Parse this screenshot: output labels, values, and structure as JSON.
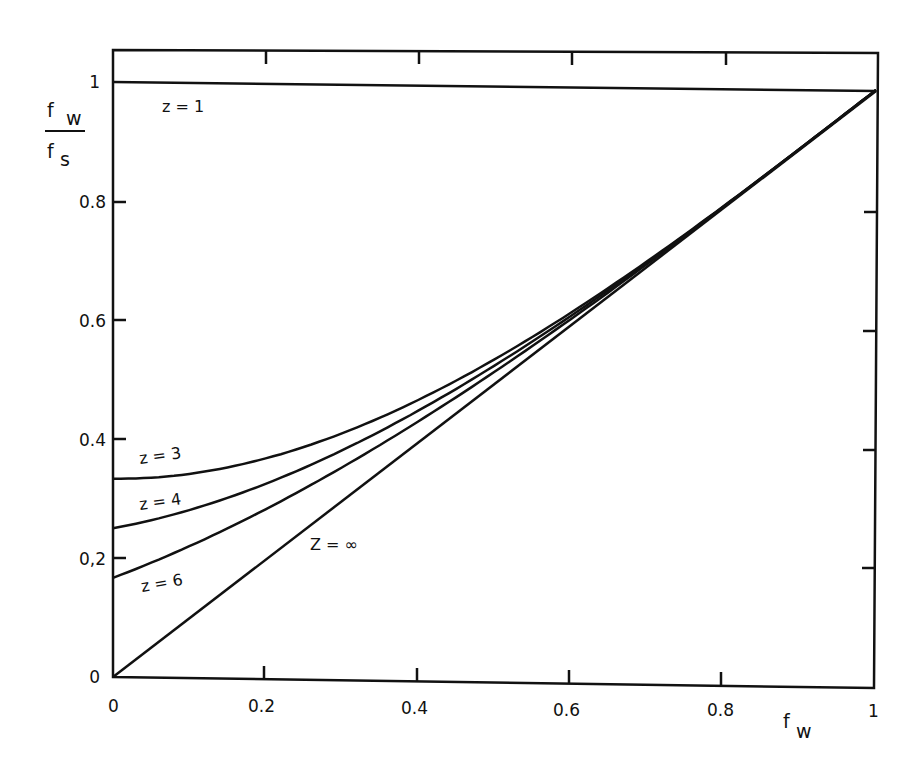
{
  "chart_data": {
    "type": "line",
    "title": "",
    "xlabel": "f_w",
    "ylabel": "f_w / f_s",
    "xlim": [
      0,
      1
    ],
    "ylim": [
      0,
      1.07
    ],
    "grid": false,
    "legend": "inline labels",
    "x_ticks": [
      "0",
      "0.2",
      "0.4",
      "0.6",
      "0.8",
      "1"
    ],
    "y_ticks": [
      "0",
      "0.2",
      "0.4",
      "0.6",
      "0.8",
      "1"
    ],
    "x": [
      0,
      0.1,
      0.2,
      0.3,
      0.4,
      0.5,
      0.6,
      0.7,
      0.8,
      0.9,
      1.0
    ],
    "series": [
      {
        "name": "z = 1",
        "values": [
          1,
          1,
          1,
          1,
          1,
          1,
          1,
          1,
          1,
          1,
          1
        ]
      },
      {
        "name": "z = 3",
        "values": [
          0.33,
          0.34,
          0.37,
          0.41,
          0.47,
          0.54,
          0.62,
          0.71,
          0.8,
          0.9,
          1.0
        ]
      },
      {
        "name": "z = 4",
        "values": [
          0.25,
          0.28,
          0.33,
          0.39,
          0.45,
          0.53,
          0.62,
          0.71,
          0.8,
          0.9,
          1.0
        ]
      },
      {
        "name": "z = 6",
        "values": [
          0.17,
          0.22,
          0.29,
          0.36,
          0.44,
          0.52,
          0.61,
          0.7,
          0.8,
          0.9,
          1.0
        ]
      },
      {
        "name": "z = ∞",
        "values": [
          0,
          0.1,
          0.2,
          0.3,
          0.4,
          0.5,
          0.6,
          0.7,
          0.8,
          0.9,
          1.0
        ]
      }
    ],
    "annotations": [
      "z = 1",
      "z = 3",
      "z = 4",
      "z = 6",
      "z = ∞"
    ]
  },
  "labels": {
    "y_num": "f",
    "y_num_sub": "w",
    "y_den": "f",
    "y_den_sub": "s",
    "x_main": "f",
    "x_sub": "w",
    "z1": "z  =  1",
    "z3": "z  = 3",
    "z4": "z  = 4",
    "z6": "z  = 6",
    "zinf": "Z  =  ∞",
    "xt0": "0",
    "xt2": "0.2",
    "xt4": "0.4",
    "xt6": "0.6",
    "xt8": "0.8",
    "xt10": "1",
    "yt0": "0",
    "yt2": "0,2",
    "yt4": "0.4",
    "yt6": "0.6",
    "yt8": "0.8",
    "yt10": "1"
  }
}
